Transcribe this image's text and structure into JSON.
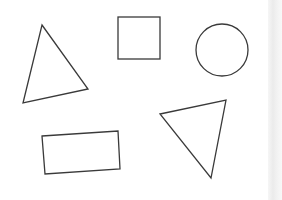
{
  "canvas": {
    "width": 282,
    "height": 200,
    "background": "#ffffff",
    "stroke_color": "#3a3a3a"
  },
  "shapes": [
    {
      "kind": "triangle",
      "label": "triangle-left",
      "points": "42,25 88,89 23,103"
    },
    {
      "kind": "square",
      "label": "square",
      "x": 118,
      "y": 17,
      "width": 42,
      "height": 42
    },
    {
      "kind": "circle",
      "label": "circle",
      "cx": 222,
      "cy": 50,
      "r": 26
    },
    {
      "kind": "rectangle",
      "label": "rectangle-rotated",
      "points": "42,136 118,131 120,169 45,174"
    },
    {
      "kind": "triangle",
      "label": "triangle-right",
      "points": "160,114 226,100 211,178"
    }
  ],
  "edge_strip": {
    "color": "#ebebeb"
  }
}
